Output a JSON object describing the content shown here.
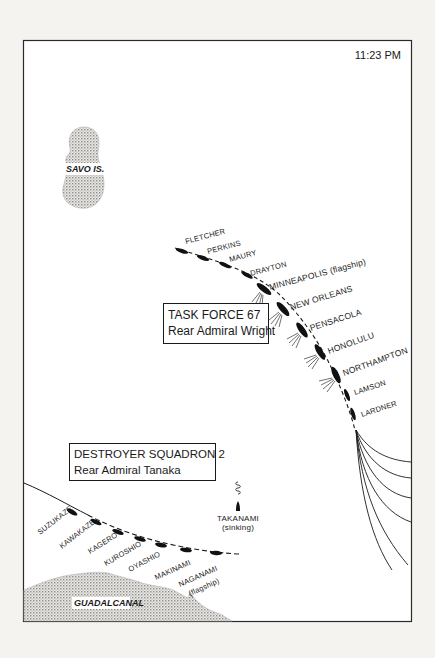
{
  "map": {
    "time": "11:23 PM",
    "islands": [
      {
        "name": "SAVO IS."
      },
      {
        "name": "GUADALCANAL"
      }
    ],
    "task_force": {
      "title": "TASK FORCE 67",
      "commander": "Rear Admiral Wright",
      "ships": [
        {
          "name": "FLETCHER"
        },
        {
          "name": "PERKINS"
        },
        {
          "name": "MAURY"
        },
        {
          "name": "DRAYTON"
        },
        {
          "name": "MINNEAPOLIS (flagship)"
        },
        {
          "name": "NEW ORLEANS"
        },
        {
          "name": "PENSACOLA"
        },
        {
          "name": "HONOLULU"
        },
        {
          "name": "NORTHAMPTON"
        },
        {
          "name": "LAMSON"
        },
        {
          "name": "LARDNER"
        }
      ]
    },
    "destroyer_squadron": {
      "title": "DESTROYER SQUADRON 2",
      "commander": "Rear Admiral Tanaka",
      "ships": [
        {
          "name": "SUZUKAZE"
        },
        {
          "name": "KAWAKAZE"
        },
        {
          "name": "KAGERO"
        },
        {
          "name": "KUROSHIO"
        },
        {
          "name": "OYASHIO"
        },
        {
          "name": "MAKINAMI"
        },
        {
          "name": "NAGANAMI"
        },
        {
          "name": "(flagship)"
        }
      ],
      "sinking_ship": {
        "name": "TAKANAMI",
        "status": "(sinking)"
      }
    },
    "colors": {
      "background": "#f4f3ef",
      "ink": "#1a1a1a",
      "land_stipple": "#9a9a9a"
    }
  }
}
